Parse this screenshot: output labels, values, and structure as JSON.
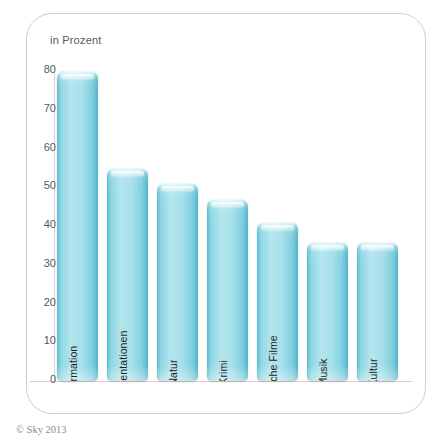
{
  "figure": {
    "axis_title": "in Prozent",
    "copyright": "© Sky 2013"
  },
  "chart_data": {
    "type": "bar",
    "title": "",
    "subtitle": "",
    "xlabel": "",
    "ylabel": "in Prozent",
    "ylim": [
      0,
      80
    ],
    "yticks": [
      0,
      10,
      20,
      30,
      40,
      50,
      60,
      70,
      80
    ],
    "grid": false,
    "legend": "none",
    "orientation": "vertical",
    "label_rotation": -90,
    "categories": [
      "Information",
      "Dokumentationen",
      "Natur",
      "Krimi",
      "Deutsche Filme",
      "Musik",
      "Kultur"
    ],
    "values": [
      80,
      55,
      51,
      47,
      41,
      36,
      36
    ],
    "bar_color": "#9ddbe8",
    "bar_edge_color": "#4fb3c9",
    "axis_color": "#e8c9c9",
    "tick_label_color": "#58595b",
    "frame_color": "#cfcfcf"
  }
}
